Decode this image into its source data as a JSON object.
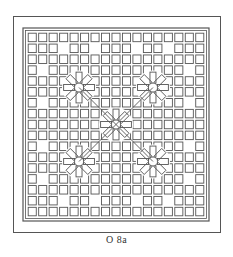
{
  "figure": {
    "caption": "O 8a",
    "line_color": "#555555",
    "background": "#ffffff"
  }
}
